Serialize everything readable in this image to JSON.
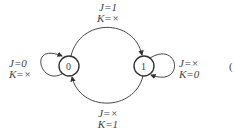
{
  "diagram": {
    "type": "state-diagram",
    "states": [
      {
        "id": "s0",
        "label": "0"
      },
      {
        "id": "s1",
        "label": "1"
      }
    ],
    "transitions": [
      {
        "from": "0",
        "to": "1",
        "label_j": "J=1",
        "label_k": "K=×"
      },
      {
        "from": "1",
        "to": "0",
        "label_j": "J=×",
        "label_k": "K=1"
      },
      {
        "from": "0",
        "to": "0",
        "label_j": "J=0",
        "label_k": "K=×"
      },
      {
        "from": "1",
        "to": "1",
        "label_j": "J=×",
        "label_k": "K=0"
      }
    ],
    "edge_fragment": "("
  }
}
